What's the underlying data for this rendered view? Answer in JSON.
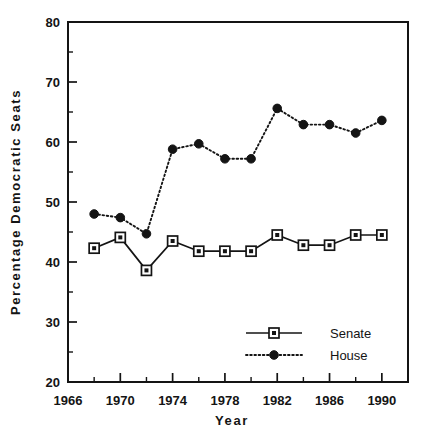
{
  "chart_data": {
    "type": "line",
    "title": "",
    "xlabel": "Year",
    "ylabel": "Percentage  Democratic  Seats",
    "xlim": [
      1966,
      1992
    ],
    "ylim": [
      20,
      80
    ],
    "grid": false,
    "legend_position": "inside-bottom-right",
    "x_major_ticks": [
      1966,
      1970,
      1974,
      1978,
      1982,
      1986,
      1990
    ],
    "x_minor_ticks": [
      1968,
      1972,
      1976,
      1980,
      1984,
      1988,
      1992
    ],
    "x_tick_labels": [
      "1966",
      "1970",
      "1974",
      "1978",
      "1982",
      "1986",
      "1990"
    ],
    "y_major_ticks": [
      20,
      30,
      40,
      50,
      60,
      70,
      80
    ],
    "y_minor_ticks": [
      25,
      35,
      45,
      55,
      65,
      75
    ],
    "y_tick_labels": [
      "20",
      "30",
      "40",
      "50",
      "60",
      "70",
      "80"
    ],
    "x": [
      1968,
      1970,
      1972,
      1974,
      1976,
      1978,
      1980,
      1982,
      1984,
      1986,
      1988,
      1990
    ],
    "series": [
      {
        "name": "Senate",
        "marker": "open-square",
        "linestyle": "solid",
        "values": [
          42.3,
          44.1,
          38.6,
          43.5,
          41.8,
          41.8,
          41.8,
          44.5,
          42.8,
          42.8,
          44.5,
          44.5
        ]
      },
      {
        "name": "House",
        "marker": "filled-diamond",
        "linestyle": "dotted",
        "values": [
          48.0,
          47.4,
          44.7,
          58.8,
          59.7,
          57.2,
          57.2,
          65.6,
          62.9,
          62.9,
          61.5,
          63.6
        ]
      }
    ],
    "legend": [
      {
        "label": "Senate",
        "marker": "open-square",
        "linestyle": "solid"
      },
      {
        "label": "House",
        "marker": "filled-diamond",
        "linestyle": "dotted"
      }
    ],
    "colors": {
      "ink": "#141414",
      "background": "#ffffff"
    }
  }
}
